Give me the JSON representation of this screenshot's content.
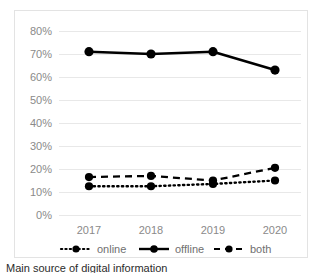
{
  "chart_data": {
    "type": "line",
    "title": "",
    "subtitle": "",
    "xlabel": "",
    "ylabel": "",
    "categories": [
      "2017",
      "2018",
      "2019",
      "2020"
    ],
    "x": [
      2017,
      2018,
      2019,
      2020
    ],
    "ylim": [
      0,
      80
    ],
    "ytick_values": [
      0,
      10,
      20,
      30,
      40,
      50,
      60,
      70,
      80
    ],
    "ytick_labels": [
      "0%",
      "10%",
      "20%",
      "30%",
      "40%",
      "50%",
      "60%",
      "70%",
      "80%"
    ],
    "xtick_labels": [
      "2017",
      "2018",
      "2019",
      "2020"
    ],
    "grid": "horizontal",
    "legend_position": "bottom-center",
    "value_format": "percent",
    "series": [
      {
        "name": "online",
        "label": "online",
        "linestyle": "dotted",
        "color": "#000000",
        "marker": "circle",
        "values": [
          12.5,
          12.5,
          13.5,
          15.0
        ]
      },
      {
        "name": "offline",
        "label": "offline",
        "linestyle": "solid",
        "color": "#000000",
        "marker": "circle",
        "values": [
          71.0,
          70.0,
          71.0,
          63.0
        ]
      },
      {
        "name": "both",
        "label": "both",
        "linestyle": "dashed",
        "color": "#000000",
        "marker": "circle",
        "values": [
          16.5,
          17.0,
          15.0,
          20.5
        ]
      }
    ],
    "colors": {
      "axis_text": "#8a8a8a",
      "legend_text": "#6f6f6f",
      "gridline": "#e8e8e8",
      "series_line": "#000000",
      "frame_border": "#e3e3e3",
      "plot_background": "#ffffff"
    }
  },
  "legend": {
    "items": [
      {
        "label": "online",
        "style": "dotted"
      },
      {
        "label": "offline",
        "style": "solid"
      },
      {
        "label": "both",
        "style": "dashed"
      }
    ]
  },
  "caption": {
    "text": "Main source of digital information"
  }
}
